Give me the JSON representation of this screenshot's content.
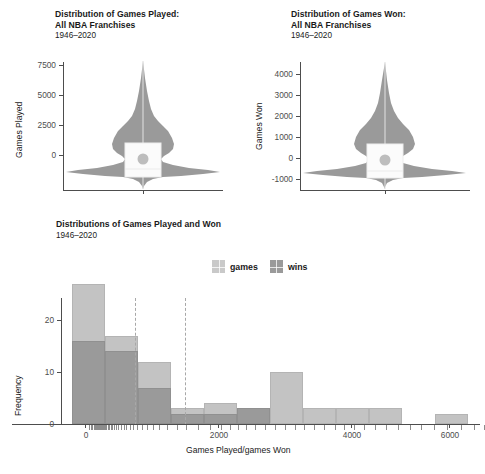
{
  "figure": {
    "width": 485,
    "height": 474,
    "background": "#ffffff",
    "colors": {
      "games": "#c3c3c3",
      "wins": "#9a9a9a",
      "violin_fill": "#9a9a9a",
      "box_fill": "#fbfbfb",
      "mean_dot": "#bdbdbd",
      "axis": "#4d4d4d",
      "dashed_line": "#a8a8a8"
    }
  },
  "panel_games_played": {
    "title_line1": "Distribution of Games Played:",
    "title_line2": "All NBA Franchises",
    "subtitle": "1946–2020",
    "ylabel": "Games Played"
  },
  "panel_games_won": {
    "title_line1": "Distribution of Games Won:",
    "title_line2": "All NBA Franchises",
    "subtitle": "1946–2020",
    "ylabel": "Games Won"
  },
  "panel_histogram": {
    "title": "Distributions of Games Played and Won",
    "subtitle": "1946–2020",
    "xlabel": "Games Played/games Won",
    "ylabel": "Frequency",
    "legend": [
      {
        "label": "games",
        "color": "#c3c3c3"
      },
      {
        "label": "wins",
        "color": "#9a9a9a"
      }
    ]
  },
  "chart_data": [
    {
      "type": "violin",
      "title": "Distribution of Games Played: All NBA Franchises",
      "subtitle": "1946–2020",
      "xlabel": "",
      "ylabel": "Games Played",
      "ylim": [
        -1800,
        7900
      ],
      "yticks": [
        0,
        2500,
        5000,
        7500
      ],
      "ytick_labels": [
        "0",
        "2500",
        "5000",
        "7500"
      ],
      "grid": false,
      "legend_position": "none",
      "series": [
        {
          "name": "Games Played",
          "mean": 1680,
          "median": 900,
          "q1": 480,
          "q3": 2680,
          "whisker_low": -1650,
          "whisker_high": 7700,
          "density_profile": [
            {
              "y": -1650,
              "w": 0.02
            },
            {
              "y": -1200,
              "w": 0.05
            },
            {
              "y": -700,
              "w": 0.14
            },
            {
              "y": -300,
              "w": 0.42
            },
            {
              "y": 0,
              "w": 0.86
            },
            {
              "y": 200,
              "w": 1.0
            },
            {
              "y": 600,
              "w": 0.72
            },
            {
              "y": 1100,
              "w": 0.4
            },
            {
              "y": 1700,
              "w": 0.34
            },
            {
              "y": 2400,
              "w": 0.38
            },
            {
              "y": 3000,
              "w": 0.46
            },
            {
              "y": 3600,
              "w": 0.45
            },
            {
              "y": 4200,
              "w": 0.36
            },
            {
              "y": 4900,
              "w": 0.24
            },
            {
              "y": 5600,
              "w": 0.15
            },
            {
              "y": 6300,
              "w": 0.09
            },
            {
              "y": 7000,
              "w": 0.04
            },
            {
              "y": 7700,
              "w": 0.01
            }
          ]
        }
      ]
    },
    {
      "type": "violin",
      "title": "Distribution of Games Won: All NBA Franchises",
      "subtitle": "1946–2020",
      "xlabel": "",
      "ylabel": "Games Won",
      "ylim": [
        -1250,
        4500
      ],
      "yticks": [
        -1000,
        0,
        1000,
        2000,
        3000,
        4000
      ],
      "ytick_labels": [
        "-1000",
        "0",
        "1000",
        "2000",
        "3000",
        "4000"
      ],
      "grid": false,
      "legend_position": "none",
      "series": [
        {
          "name": "Games Won",
          "mean": 790,
          "median": 300,
          "q1": 170,
          "q3": 1480,
          "whisker_low": -1150,
          "whisker_high": 4350,
          "density_profile": [
            {
              "y": -1150,
              "w": 0.02
            },
            {
              "y": -800,
              "w": 0.06
            },
            {
              "y": -450,
              "w": 0.17
            },
            {
              "y": -150,
              "w": 0.48
            },
            {
              "y": 100,
              "w": 0.92
            },
            {
              "y": 230,
              "w": 1.0
            },
            {
              "y": 500,
              "w": 0.7
            },
            {
              "y": 800,
              "w": 0.4
            },
            {
              "y": 1100,
              "w": 0.33
            },
            {
              "y": 1500,
              "w": 0.38
            },
            {
              "y": 1850,
              "w": 0.47
            },
            {
              "y": 2200,
              "w": 0.45
            },
            {
              "y": 2600,
              "w": 0.35
            },
            {
              "y": 3000,
              "w": 0.24
            },
            {
              "y": 3450,
              "w": 0.15
            },
            {
              "y": 3900,
              "w": 0.07
            },
            {
              "y": 4350,
              "w": 0.01
            }
          ]
        }
      ]
    },
    {
      "type": "bar",
      "subtype": "histogram-overlay",
      "title": "Distributions of Games Played and Won",
      "subtitle": "1946–2020",
      "xlabel": "Games Played/games Won",
      "ylabel": "Frequency",
      "xlim": [
        -250,
        6250
      ],
      "ylim": [
        0,
        28
      ],
      "xticks": [
        0,
        2000,
        4000,
        6000
      ],
      "xtick_labels": [
        "0",
        "2000",
        "4000",
        "6000"
      ],
      "yticks": [
        0,
        10,
        20
      ],
      "ytick_labels": [
        "0",
        "10",
        "20"
      ],
      "bin_width": 500,
      "bin_starts": [
        0,
        500,
        1000,
        1500,
        2000,
        2500,
        3000,
        3500,
        4000,
        4500,
        5000,
        5500
      ],
      "grid": false,
      "legend_position": "top",
      "series": [
        {
          "name": "games",
          "color": "#c3c3c3",
          "values": [
            27,
            17,
            12,
            3,
            4,
            3,
            10,
            3,
            3,
            3,
            0,
            2
          ]
        },
        {
          "name": "wins",
          "color": "#9a9a9a",
          "values": [
            16,
            14,
            7,
            2,
            2,
            3,
            0,
            0,
            0,
            0,
            0,
            0
          ]
        }
      ],
      "reference_lines": [
        {
          "value": 1680,
          "style": "dashed",
          "color": "#a8a8a8",
          "label": "mean games"
        },
        {
          "value": 2440,
          "style": "dashed",
          "color": "#a8a8a8",
          "label": "mean wins"
        }
      ],
      "rug": {
        "present": true,
        "values": [
          60,
          90,
          110,
          130,
          150,
          160,
          175,
          190,
          205,
          215,
          230,
          245,
          260,
          275,
          290,
          305,
          320,
          340,
          360,
          385,
          410,
          440,
          470,
          500,
          540,
          580,
          620,
          670,
          720,
          780,
          850,
          930,
          1020,
          1120,
          1240,
          1380,
          1520,
          1700,
          1880,
          2050,
          2180,
          2300,
          2420,
          2560,
          2700,
          2850,
          3000,
          3160,
          3300,
          3450,
          3600,
          3760,
          3900,
          4050,
          4200,
          4360,
          4520,
          4700,
          4880,
          5060,
          5250,
          5450,
          5650,
          5850,
          6000
        ]
      }
    }
  ]
}
